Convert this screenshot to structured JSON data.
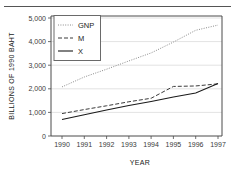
{
  "chart_data": {
    "type": "line",
    "title": "",
    "xlabel": "YEAR",
    "ylabel": "BILLIONS OF 1990 BAHT",
    "x": [
      1990,
      1991,
      1992,
      1993,
      1994,
      1995,
      1996,
      1997
    ],
    "xtick_labels": [
      "1990",
      "1991",
      "1992",
      "1993",
      "1994",
      "1995",
      "1996",
      "1997"
    ],
    "ytick_labels": [
      "0",
      "1,000",
      "2,000",
      "3,000",
      "4,000",
      "5,000"
    ],
    "yticks": [
      0,
      1000,
      2000,
      3000,
      4000,
      5000
    ],
    "ylim": [
      0,
      5000
    ],
    "xlim": [
      1990,
      1997
    ],
    "grid": true,
    "legend_position": "top-left",
    "series": [
      {
        "name": "GNP",
        "style": "dotted",
        "color": "#8a8a8a",
        "values": [
          2080,
          2500,
          2830,
          3180,
          3520,
          3980,
          4480,
          4700
        ]
      },
      {
        "name": "M",
        "style": "dashed",
        "color": "#3a3a3a",
        "values": [
          950,
          1120,
          1280,
          1450,
          1600,
          2100,
          2120,
          2210
        ]
      },
      {
        "name": "X",
        "style": "solid",
        "color": "#1a1a1a",
        "values": [
          700,
          900,
          1100,
          1290,
          1460,
          1650,
          1820,
          2220
        ]
      }
    ]
  },
  "figure": {
    "legend_entries": [
      "GNP",
      "M",
      "X"
    ]
  }
}
